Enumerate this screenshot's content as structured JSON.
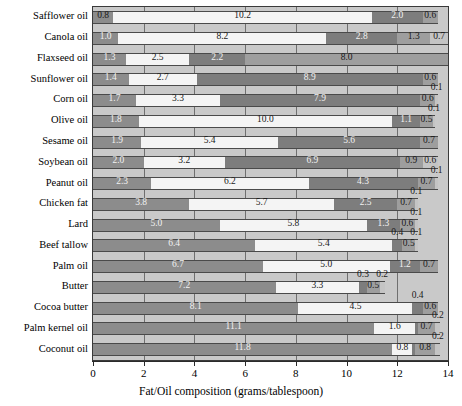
{
  "chart_data": {
    "type": "bar",
    "orientation": "horizontal",
    "stacked": true,
    "title": "",
    "xlabel": "Fat/Oil composition (grams/tablespoon)",
    "ylabel": "",
    "xlim": [
      0,
      14
    ],
    "xticks": [
      0,
      2,
      4,
      6,
      8,
      10,
      12,
      14
    ],
    "grid": true,
    "legend": "none",
    "categories": [
      "Safflower oil",
      "Canola oil",
      "Flaxseed oil",
      "Sunflower oil",
      "Corn oil",
      "Olive oil",
      "Sesame oil",
      "Soybean oil",
      "Peanut oil",
      "Chicken fat",
      "Lard",
      "Beef tallow",
      "Palm oil",
      "Butter",
      "Cocoa butter",
      "Palm kernel oil",
      "Coconut oil"
    ],
    "series": [
      {
        "name": "segment-1",
        "values": [
          0.8,
          1.0,
          1.3,
          1.4,
          1.7,
          1.8,
          1.9,
          2.0,
          2.3,
          3.8,
          5.0,
          6.4,
          6.7,
          7.2,
          8.1,
          11.1,
          11.8
        ]
      },
      {
        "name": "segment-2",
        "values": [
          10.2,
          8.2,
          2.5,
          2.7,
          3.3,
          10.0,
          5.4,
          3.2,
          6.2,
          5.7,
          5.8,
          5.4,
          5.0,
          3.3,
          4.5,
          1.6,
          0.8
        ]
      },
      {
        "name": "segment-3",
        "values": [
          2.0,
          2.8,
          2.2,
          8.9,
          7.9,
          1.1,
          5.6,
          6.9,
          4.3,
          2.5,
          1.3,
          0.4,
          1.2,
          0.3,
          0.4,
          0.1,
          0.1
        ]
      },
      {
        "name": "segment-4",
        "values": [
          0.6,
          1.3,
          8.0,
          0.6,
          0.6,
          0.5,
          0.7,
          0.9,
          0.7,
          0.7,
          0.6,
          0.5,
          0.7,
          0.5,
          0.6,
          0.7,
          0.8
        ]
      },
      {
        "name": "segment-5",
        "values": [
          0.0,
          0.7,
          0.0,
          0.0,
          0.1,
          0.1,
          0.0,
          0.6,
          0.1,
          0.1,
          0.1,
          0.1,
          0.0,
          0.2,
          0.0,
          0.2,
          0.2
        ]
      }
    ],
    "segment_colors": [
      "#8c8c8c",
      "#f4f4f4",
      "#7d7d7d",
      "#9e9e9e",
      "#c4c4c4"
    ],
    "plot_background": "#c9c9c9",
    "rows": [
      {
        "category": "Safflower oil",
        "segments": [
          0.8,
          10.2,
          2.0,
          0.6
        ],
        "labels": [
          "0.8",
          "10.2",
          "2.0",
          "0.6"
        ]
      },
      {
        "category": "Canola oil",
        "segments": [
          1.0,
          8.2,
          2.8,
          1.3,
          0.7
        ],
        "labels": [
          "1.0",
          "8.2",
          "2.8",
          "1.3",
          "0.7"
        ]
      },
      {
        "category": "Flaxseed oil",
        "segments": [
          1.3,
          2.5,
          2.2,
          8.0
        ],
        "labels": [
          "1.3",
          "2.5",
          "2.2",
          "8.0"
        ]
      },
      {
        "category": "Sunflower oil",
        "segments": [
          1.4,
          2.7,
          8.9,
          0.6
        ],
        "labels": [
          "1.4",
          "2.7",
          "8.9",
          "0.6"
        ]
      },
      {
        "category": "Corn oil",
        "segments": [
          1.7,
          3.3,
          7.9,
          0.6,
          0.1
        ],
        "labels": [
          "1.7",
          "3.3",
          "7.9",
          "0.6",
          "0.1"
        ]
      },
      {
        "category": "Olive oil",
        "segments": [
          1.8,
          10.0,
          1.1,
          0.5,
          0.1
        ],
        "labels": [
          "1.8",
          "10.0",
          "1.1",
          "0.5",
          "0.1"
        ]
      },
      {
        "category": "Sesame oil",
        "segments": [
          1.9,
          5.4,
          5.6,
          0.7
        ],
        "labels": [
          "1.9",
          "5.4",
          "5.6",
          "0.7"
        ]
      },
      {
        "category": "Soybean oil",
        "segments": [
          2.0,
          3.2,
          6.9,
          0.9,
          0.6
        ],
        "labels": [
          "2.0",
          "3.2",
          "6.9",
          "0.9",
          "0.6"
        ]
      },
      {
        "category": "Peanut oil",
        "segments": [
          2.3,
          6.2,
          4.3,
          0.7,
          0.1
        ],
        "labels": [
          "2.3",
          "6.2",
          "4.3",
          "0.7",
          "0.1"
        ]
      },
      {
        "category": "Chicken fat",
        "segments": [
          3.8,
          5.7,
          2.5,
          0.7,
          0.1
        ],
        "labels": [
          "3.8",
          "5.7",
          "2.5",
          "0.7",
          "0.1"
        ]
      },
      {
        "category": "Lard",
        "segments": [
          5.0,
          5.8,
          1.3,
          0.6,
          0.1
        ],
        "labels": [
          "5.0",
          "5.8",
          "1.3",
          "0.6",
          "0.1"
        ]
      },
      {
        "category": "Beef tallow",
        "segments": [
          6.4,
          5.4,
          0.4,
          0.5,
          0.1
        ],
        "labels": [
          "6.4",
          "5.4",
          "0.4",
          "0.5",
          "0.1"
        ]
      },
      {
        "category": "Palm oil",
        "segments": [
          6.7,
          5.0,
          1.2,
          0.7
        ],
        "labels": [
          "6.7",
          "5.0",
          "1.2",
          "0.7"
        ]
      },
      {
        "category": "Butter",
        "segments": [
          7.2,
          3.3,
          0.3,
          0.5,
          0.2
        ],
        "labels": [
          "7.2",
          "3.3",
          "0.3",
          "0.5",
          "0.2"
        ]
      },
      {
        "category": "Cocoa butter",
        "segments": [
          8.1,
          4.5,
          0.4,
          0.6
        ],
        "labels": [
          "8.1",
          "4.5",
          "0.4",
          "0.6"
        ]
      },
      {
        "category": "Palm kernel oil",
        "segments": [
          11.1,
          1.6,
          0.1,
          0.7,
          0.2
        ],
        "labels": [
          "11.1",
          "1.6",
          "",
          "0.7",
          "0.2"
        ]
      },
      {
        "category": "Coconut oil",
        "segments": [
          11.8,
          0.8,
          0.1,
          0.8,
          0.2
        ],
        "labels": [
          "11.8",
          "0.8",
          "",
          "0.8",
          "0.2"
        ]
      }
    ]
  }
}
